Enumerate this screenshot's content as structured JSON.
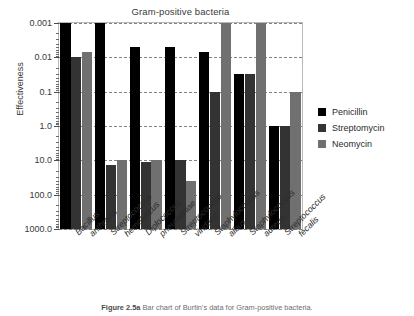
{
  "figure": {
    "caption_label": "Figure 2.5a",
    "caption_text": "Bar chart of Burtin's data for Gram-positive bacteria."
  },
  "legend": {
    "position": "right",
    "entries": [
      {
        "label": "Penicillin",
        "color": "#000000"
      },
      {
        "label": "Streptomycin",
        "color": "#333333"
      },
      {
        "label": "Neomycin",
        "color": "#707070"
      }
    ]
  },
  "chart_data": {
    "type": "bar",
    "title": "Gram-positive bacteria",
    "xlabel": "",
    "ylabel": "Effectiveness",
    "yscale": "log",
    "y_inverted": true,
    "ylim": [
      0.001,
      1000.0
    ],
    "grid": true,
    "tick_labels": [
      "0.001",
      "0.01",
      "0.1",
      "1.0",
      "10.0",
      "100.0",
      "1000.0"
    ],
    "tick_values": [
      0.001,
      0.01,
      0.1,
      1.0,
      10.0,
      100.0,
      1000.0
    ],
    "categories": [
      "Bacillus anthracis",
      "Streptococcus hemolyticus",
      "Diplococcus pneumoniae",
      "Streptococcus viridans",
      "Staphylococcus albus",
      "Staphylococcus aureus",
      "Streptococcus fecalis"
    ],
    "categories_lines": [
      [
        "Bacillus",
        "anthracis"
      ],
      [
        "Streptococcus",
        "hemolyticus"
      ],
      [
        "Diplococcus",
        "pneumoniae"
      ],
      [
        "Streptococcus",
        "viridans"
      ],
      [
        "Staphylococcus",
        "albus"
      ],
      [
        "Staphylococcus",
        "aureus"
      ],
      [
        "Streptococcus",
        "fecalis"
      ]
    ],
    "series": [
      {
        "name": "Penicillin",
        "color": "#000000",
        "values": [
          0.001,
          0.001,
          0.005,
          0.005,
          0.007,
          0.03,
          1.0
        ]
      },
      {
        "name": "Streptomycin",
        "color": "#333333",
        "values": [
          0.01,
          14.0,
          11.0,
          10.0,
          0.1,
          0.03,
          1.0
        ]
      },
      {
        "name": "Neomycin",
        "color": "#707070",
        "values": [
          0.007,
          10.0,
          10.0,
          40.0,
          0.001,
          0.001,
          0.1
        ]
      }
    ]
  }
}
